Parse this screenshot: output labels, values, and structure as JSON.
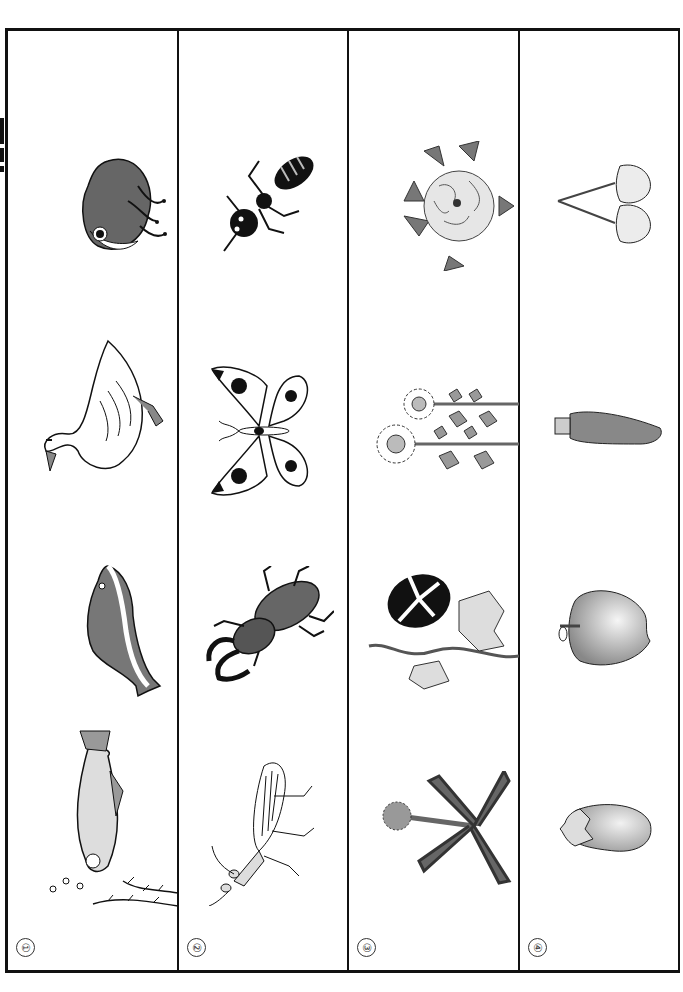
{
  "worksheet": {
    "orientation": "rotated-90",
    "columns": [
      {
        "number": "①",
        "category": "animals",
        "items": [
          {
            "name": "frog-icon",
            "label": "frog"
          },
          {
            "name": "swan-icon",
            "label": "swan"
          },
          {
            "name": "dolphin-icon",
            "label": "dolphin"
          },
          {
            "name": "fish-icon",
            "label": "fish"
          }
        ]
      },
      {
        "number": "②",
        "category": "insects",
        "items": [
          {
            "name": "ant-icon",
            "label": "ant"
          },
          {
            "name": "butterfly-icon",
            "label": "butterfly"
          },
          {
            "name": "stag-beetle-icon",
            "label": "stag beetle"
          },
          {
            "name": "praying-mantis-icon",
            "label": "praying mantis"
          }
        ]
      },
      {
        "number": "③",
        "category": "flowers",
        "items": [
          {
            "name": "peony-icon",
            "label": "peony"
          },
          {
            "name": "sunflower-icon",
            "label": "sunflower"
          },
          {
            "name": "morning-glory-icon",
            "label": "morning glory"
          },
          {
            "name": "dandelion-icon",
            "label": "dandelion"
          }
        ]
      },
      {
        "number": "④",
        "category": "fruits-vegetables",
        "items": [
          {
            "name": "cherry-icon",
            "label": "cherry"
          },
          {
            "name": "carrot-icon",
            "label": "carrot"
          },
          {
            "name": "apple-icon",
            "label": "apple"
          },
          {
            "name": "eggplant-icon",
            "label": "eggplant"
          }
        ]
      }
    ]
  },
  "colors": {
    "border": "#111111",
    "dark_fill": "#555555",
    "mid_fill": "#8a8a8a",
    "light_fill": "#dddddd"
  }
}
